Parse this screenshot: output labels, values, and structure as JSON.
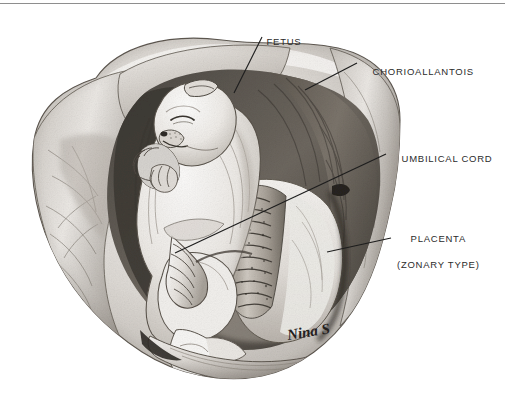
{
  "figure": {
    "medium": "graphite/charcoal pencil drawing, grayscale",
    "background_color": "#ffffff",
    "text_color": "#2b2b2b",
    "leader_line_color": "#1d1d1d",
    "top_rule_color": "#8e8e8e"
  },
  "labels": [
    {
      "id": "fetus",
      "text": "FETUS",
      "leader": {
        "x1": 262,
        "y1": 37,
        "x2": 234,
        "y2": 93
      }
    },
    {
      "id": "chorioallantois",
      "text": "CHORIOALLANTOIS",
      "leader": {
        "x1": 357,
        "y1": 63,
        "x2": 305,
        "y2": 90
      }
    },
    {
      "id": "umbilical_cord",
      "text": "UMBILICAL CORD",
      "leader": {
        "x1": 386,
        "y1": 154,
        "x2": 175,
        "y2": 253
      }
    },
    {
      "id": "placenta",
      "text": "PLACENTA",
      "text_line2": "(ZONARY TYPE)",
      "leader": {
        "x1": 391,
        "y1": 238,
        "x2": 327,
        "y2": 252
      }
    }
  ],
  "signature": {
    "text": "Nina S",
    "x": 288,
    "y": 328
  }
}
